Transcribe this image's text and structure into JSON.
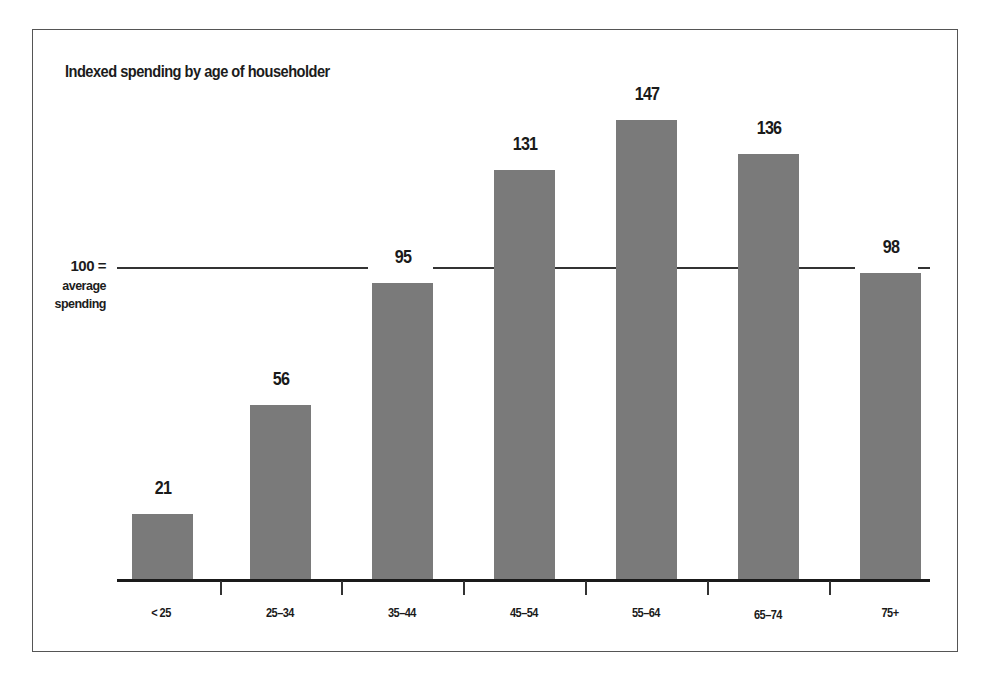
{
  "chart_data": {
    "type": "bar",
    "title": "Indexed spending by age of householder",
    "xlabel": "",
    "ylabel": "",
    "categories": [
      "< 25",
      "25–34",
      "35–44",
      "45–54",
      "55–64",
      "65–74",
      "75+"
    ],
    "values": [
      21,
      56,
      95,
      131,
      147,
      136,
      98
    ],
    "value_labels": [
      "21",
      "56",
      "95",
      "131",
      "147",
      "136",
      "98"
    ],
    "reference_line": {
      "value": 100,
      "label": "100 =",
      "sublabel_line1": "average",
      "sublabel_line2": "spending"
    },
    "ylim": [
      0,
      150
    ],
    "grid": false,
    "legend": null,
    "bar_color": "#7a7a7a"
  }
}
